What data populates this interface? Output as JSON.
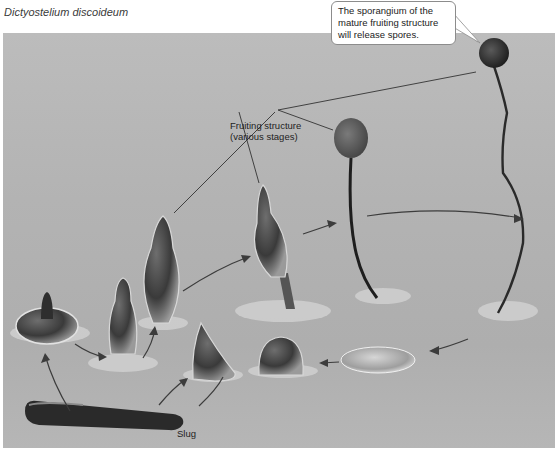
{
  "figure": {
    "species_title": "Dictyostelium discoideum",
    "callout": {
      "line1": "The sporangium of the",
      "line2": "mature fruiting structure",
      "line3": "will release spores."
    },
    "labels": {
      "fruiting_line1": "Fruiting structure",
      "fruiting_line2": "(various stages)",
      "slug": "Slug"
    },
    "stages": [
      "slug",
      "mexican-hat aggregate",
      "finger / culminant",
      "early culminant",
      "mid culminant",
      "fruiting body (young)",
      "fruiting body (mature, with sporangium)",
      "aggregate mound",
      "tipped mound",
      "tight aggregate"
    ],
    "colors": {
      "background": "#ffffff",
      "photo_bg": "#b4b4b4",
      "callout_border": "#8c8c8c",
      "arrow": "#3c3c3c",
      "text": "#222222"
    }
  }
}
